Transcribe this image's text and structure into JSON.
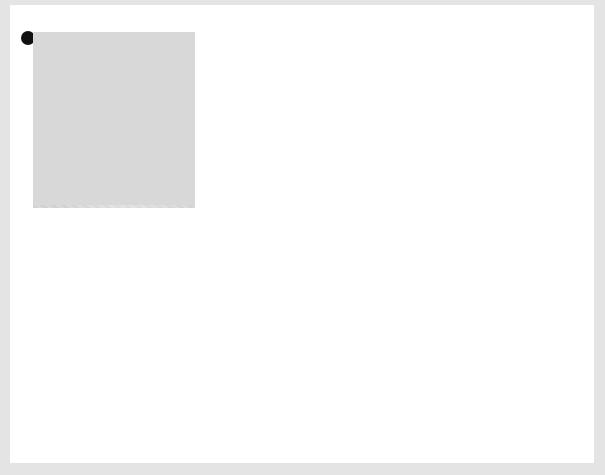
{
  "diagrams": [
    {
      "number": "3",
      "caption": "48 hour chick",
      "labels": [
        "brain",
        "ear",
        "notochord",
        "eye",
        "aortic arches",
        "pharynx",
        "heart",
        "vein from yolk sac",
        "somites",
        "artery to yolk sac",
        "tail bud"
      ]
    },
    {
      "number": "4",
      "caption": "72 hour chick",
      "labels": [
        "brain",
        "ear",
        "notochord",
        "aortic arches",
        "gill slits",
        "eye",
        "pharynx",
        "olfactory pit",
        "lung bud",
        "heart",
        "liver region",
        "wing bud",
        "artery to",
        "yolk sac",
        "vein from",
        "yolk sac",
        "spinal cord",
        "leg bud",
        "somites",
        "tail bud"
      ]
    }
  ],
  "colors": {
    "embryo": "#9a9a9a",
    "vessel": "#3a3a3a",
    "panel": "#d6d6d6",
    "background": "#e4e4e4"
  }
}
